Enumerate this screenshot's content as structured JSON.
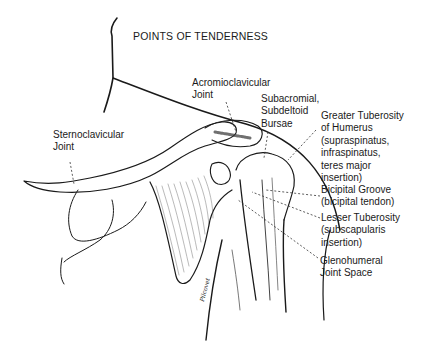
{
  "title": "POINTS OF TENDERNESS",
  "labels": {
    "acromioclavicular": [
      "Acromioclavicular",
      "Joint"
    ],
    "subacromial": [
      "Subacromial,",
      "Subdeltoid",
      "Bursae"
    ],
    "greater_tuberosity": [
      "Greater Tuberosity",
      "of Humerus",
      "(supraspinatus,",
      "infraspinatus,",
      "teres major",
      "insertion)"
    ],
    "sternoclavicular": [
      "Sternoclavicular",
      "Joint"
    ],
    "bicipital_groove": [
      "Bicipital Groove",
      "(bicipital tendon)"
    ],
    "lesser_tuberosity": [
      "Lesser Tuberosity",
      "(subscapularis",
      "insertion)"
    ],
    "glenohumeral": [
      "Glenohumeral",
      "Joint Space"
    ]
  },
  "signature": "Pilcovet"
}
